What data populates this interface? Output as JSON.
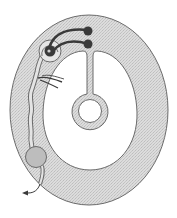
{
  "diagram": {
    "type": "anatomical-schematic",
    "labels": [],
    "colors": {
      "background": "#ffffff",
      "ring_fill": "#d9d9d9",
      "outline": "#6b6b6b",
      "dark_nodes": "#3a3a3a",
      "bulb_fill": "#bdbdbd",
      "inner_fill": "#ffffff"
    },
    "elements": {
      "outer_ring": "outer oval band (stippled gray)",
      "inner_cavity": "white inner oval cavity",
      "central_stalk": "stalk descending from top notch",
      "central_ring": "ring at end of stalk",
      "top_nodes": "two dark terminal nodes",
      "coiled_center": "coiled structure at upper left",
      "branch_tuft": "small branching tuft",
      "duct": "wavy duct along left side",
      "bulb": "round swelling near bottom left",
      "exit_arrow": "arrow exiting bottom left"
    }
  }
}
